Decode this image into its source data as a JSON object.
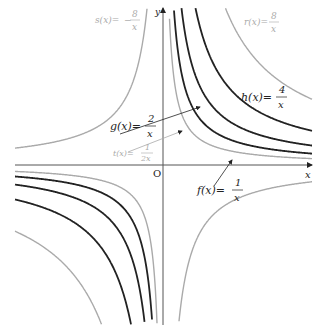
{
  "axes": {
    "x_label": "x",
    "y_label": "y",
    "origin_label": "O",
    "origin_px": [
      163,
      165
    ],
    "axis_color": "#555555"
  },
  "functions": [
    {
      "id": "t",
      "name": "t(x)",
      "numerator": "1",
      "denominator": "2x",
      "k": 0.5,
      "k_px": 950,
      "color": "#aaaaaa",
      "width": 1.4
    },
    {
      "id": "f",
      "name": "f(x)",
      "numerator": "1",
      "denominator": "x",
      "k": 1,
      "k_px": 1700,
      "color": "#222222",
      "width": 1.8
    },
    {
      "id": "g",
      "name": "g(x)",
      "numerator": "2",
      "denominator": "x",
      "k": 2,
      "k_px": 2900,
      "color": "#222222",
      "width": 1.8
    },
    {
      "id": "h",
      "name": "h(x)",
      "numerator": "4",
      "denominator": "x",
      "k": 4,
      "k_px": 5100,
      "color": "#222222",
      "width": 1.8
    },
    {
      "id": "r",
      "name": "r(x)",
      "numerator": "8",
      "denominator": "x",
      "k": 8,
      "k_px": 9800,
      "color": "#aaaaaa",
      "width": 1.4
    },
    {
      "id": "s",
      "name": "s(x)",
      "numerator": "8",
      "denominator": "x",
      "sign": "-",
      "k": -8,
      "k_px": -2500,
      "color": "#aaaaaa",
      "width": 1.4
    }
  ],
  "labels": {
    "s": {
      "text": "s(x)=",
      "num": "8",
      "den": "x",
      "neg": "−"
    },
    "r": {
      "text": "r(x)=",
      "num": "8",
      "den": "x"
    },
    "h": {
      "text": "h(x)=",
      "num": "4",
      "den": "x"
    },
    "g": {
      "text": "g(x)=",
      "num": "2",
      "den": "x"
    },
    "t": {
      "text": "t(x)=",
      "num": "1",
      "den": "2x"
    },
    "f": {
      "text": "f(x)=",
      "num": "1",
      "den": "x"
    }
  }
}
